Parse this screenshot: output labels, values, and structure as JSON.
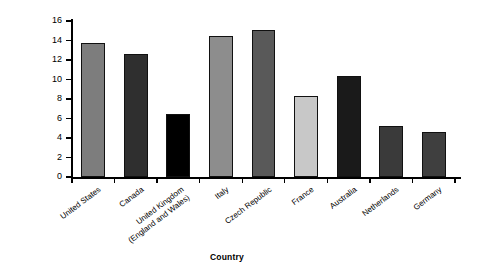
{
  "chart_data": {
    "type": "bar",
    "title": "",
    "xlabel": "Country",
    "ylabel": "Percentage",
    "ylim": [
      0,
      16
    ],
    "ytick_step": 2,
    "yticks": [
      0,
      2,
      4,
      6,
      8,
      10,
      12,
      14,
      16
    ],
    "grid": false,
    "legend": "none",
    "categories": [
      "United States",
      "Canada",
      "United Kingdom (England and Wales)",
      "Italy",
      "Czech Republic",
      "France",
      "Australia",
      "Netherlands",
      "Germany"
    ],
    "values": [
      13.7,
      12.6,
      6.5,
      14.5,
      15.1,
      8.3,
      10.4,
      5.2,
      4.6
    ],
    "bar_colors": [
      "#7d7d7d",
      "#2f2f2f",
      "#000000",
      "#8d8d8d",
      "#595959",
      "#c8c8c8",
      "#1a1a1a",
      "#3a3a3a",
      "#3f3f3f"
    ]
  },
  "axis": {
    "x_title": "Country",
    "y_title": "Percentage",
    "y_labels": [
      "0",
      "2",
      "4",
      "6",
      "8",
      "10",
      "12",
      "14",
      "16"
    ]
  }
}
